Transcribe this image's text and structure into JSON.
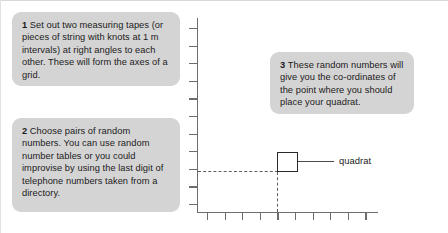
{
  "figure": {
    "background_color": "#ffffff",
    "callout_background": "#d5d4d4",
    "axis_color": "#6d6d6d",
    "quadrat_color": "#2a2a2a"
  },
  "callouts": [
    {
      "number": "1",
      "text": "Set out two measuring tapes (or pieces of string with knots at 1 m intervals) at right angles to each other. These will form the axes of a grid."
    },
    {
      "number": "2",
      "text": "Choose pairs of random numbers. You can use random number tables or you could improvise by using the last digit of telephone numbers taken from a directory."
    },
    {
      "number": "3",
      "text": "These random numbers will give you the co-ordinates of the point where you should place your quadrat."
    }
  ],
  "diagram": {
    "quadrat_label": "quadrat",
    "vertical_axis": {
      "name": "y-axis",
      "tick_count": 11
    },
    "horizontal_axis": {
      "name": "x-axis",
      "tick_count": 10
    },
    "quadrat": {
      "name": "quadrat-square",
      "x_units": 4.5,
      "y_units": 2.5
    }
  }
}
